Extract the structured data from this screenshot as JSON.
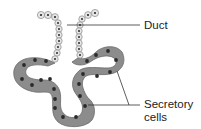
{
  "diagram": {
    "type": "gland-structure",
    "labels": {
      "duct": "Duct",
      "secretory_line1": "Secretory",
      "secretory_line2": "cells"
    },
    "colors": {
      "duct_cell_fill": "#e6e6e6",
      "duct_cell_stroke": "#8a8a8a",
      "secretory_cell_fill": "#8c8c8c",
      "secretory_cell_stroke": "#6a6a6a",
      "nucleus": "#2a2a2a",
      "leader_line": "#333333",
      "text": "#222222"
    }
  }
}
